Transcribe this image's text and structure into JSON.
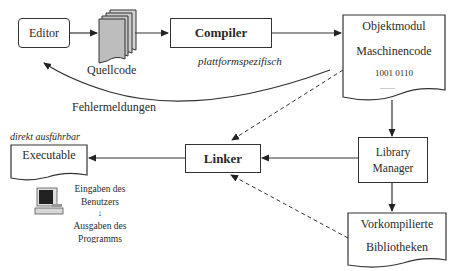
{
  "diagram": {
    "nodes": {
      "editor": {
        "label": "Editor",
        "shape": "rounded-rect"
      },
      "quellcode": {
        "label": "Quellcode",
        "shape": "document-stack"
      },
      "compiler": {
        "label": "Compiler",
        "shape": "rect",
        "bold": true
      },
      "objektmodul": {
        "title": "Objektmodul",
        "subtitle": "Maschinencode",
        "bits": "1001 0110",
        "dots": "..........",
        "shape": "document"
      },
      "library_manager": {
        "line1": "Library",
        "line2": "Manager",
        "shape": "rect"
      },
      "vorkompilierte": {
        "line1": "Vorkompilierte",
        "line2": "Bibliotheken",
        "shape": "document"
      },
      "linker": {
        "label": "Linker",
        "shape": "rect",
        "bold": true
      },
      "executable": {
        "label": "Executable",
        "shape": "document"
      }
    },
    "annotations": {
      "plattformspezifisch": "plattformspezifisch",
      "fehlermeldungen": "Fehlermeldungen",
      "direkt_ausfuehrbar": "direkt ausführbar",
      "io_line1": "Eingaben des",
      "io_line2": "Benutzers",
      "io_arrow": "↓",
      "io_line3": "Ausgaben des",
      "io_line4": "Programms"
    },
    "edges": [
      {
        "from": "Editor",
        "to": "Quellcode",
        "style": "solid"
      },
      {
        "from": "Quellcode",
        "to": "Compiler",
        "style": "solid"
      },
      {
        "from": "Compiler",
        "to": "Objektmodul",
        "style": "solid"
      },
      {
        "from": "Compiler",
        "to": "Editor",
        "label": "Fehlermeldungen",
        "style": "curved"
      },
      {
        "from": "Objektmodul",
        "to": "Linker",
        "style": "dashed"
      },
      {
        "from": "Objektmodul",
        "to": "Library Manager",
        "style": "solid"
      },
      {
        "from": "Library Manager",
        "to": "Linker",
        "style": "solid"
      },
      {
        "from": "Library Manager",
        "to": "Vorkompilierte Bibliotheken",
        "style": "solid"
      },
      {
        "from": "Vorkompilierte Bibliotheken",
        "to": "Linker",
        "style": "dashed"
      },
      {
        "from": "Linker",
        "to": "Executable",
        "style": "solid"
      }
    ],
    "colors": {
      "line": "#333333",
      "stack_fill": "#c8c8c8",
      "text": "#2a2a2a"
    }
  }
}
